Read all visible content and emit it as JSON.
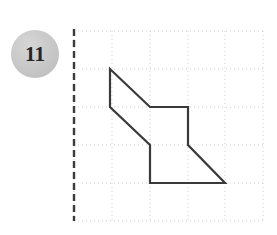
{
  "page": {
    "width": 277,
    "height": 235,
    "background": "#ffffff"
  },
  "badge": {
    "number": "11",
    "shape": "circle",
    "fill_color": "#c6c6c6",
    "text_color": "#262626",
    "center_x": 35,
    "center_y": 54,
    "radius": 24
  },
  "axis": {
    "name": "mirror-line",
    "style": "dashed",
    "orientation": "vertical",
    "color": "#3b3b3b",
    "x": 74,
    "y_top": 29,
    "y_bottom": 221,
    "dash": "7,4",
    "width": 2.4
  },
  "grid": {
    "color": "#cfcfd6",
    "style": "dotted",
    "width": 1,
    "dash": "1,3",
    "x_lines": [
      74,
      112,
      150,
      188,
      225,
      263
    ],
    "y_lines": [
      31,
      69,
      107,
      145,
      183,
      221
    ],
    "cell_width": 38,
    "cell_height": 38,
    "columns": 5,
    "rows": 5
  },
  "chart_data": {
    "type": "polygon",
    "shape_name": "irregular-hexagon-arrow",
    "stroke_color": "#3a3a3a",
    "stroke_width": 2.2,
    "fill": "none",
    "closed": true,
    "vertices_px": [
      [
        110,
        69
      ],
      [
        150,
        107
      ],
      [
        188,
        107
      ],
      [
        188,
        145
      ],
      [
        225,
        183
      ],
      [
        150,
        183
      ],
      [
        150,
        145
      ],
      [
        110,
        107
      ]
    ],
    "vertices_grid": [
      [
        1,
        1
      ],
      [
        2,
        2
      ],
      [
        3,
        2
      ],
      [
        3,
        3
      ],
      [
        4,
        4
      ],
      [
        2,
        4
      ],
      [
        2,
        3
      ],
      [
        1,
        2
      ]
    ],
    "grid_origin_px": [
      74,
      31
    ],
    "grid_cell_px": [
      38,
      38
    ],
    "xlabel": "",
    "ylabel": "",
    "legend": []
  }
}
